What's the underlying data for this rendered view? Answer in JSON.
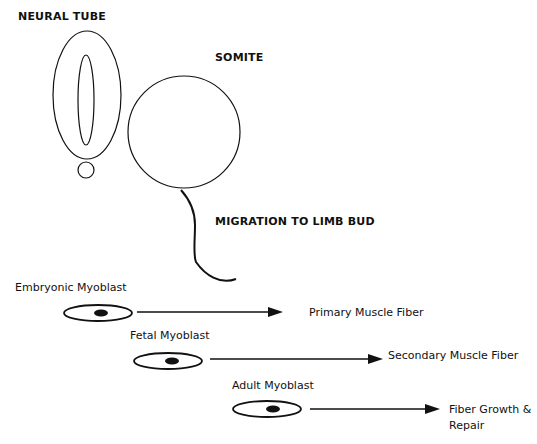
{
  "diagram": {
    "title_neural_tube": "NEURAL TUBE",
    "title_somite": "SOMITE",
    "migration_label": "MIGRATION TO LIMB BUD",
    "stages": [
      {
        "cell": "Embryonic Myoblast",
        "result": "Primary Muscle Fiber"
      },
      {
        "cell": "Fetal Myoblast",
        "result": "Secondary Muscle Fiber"
      },
      {
        "cell": "Adult Myoblast",
        "result_line1": "Fiber Growth &",
        "result_line2": "Repair"
      }
    ],
    "colors": {
      "stroke": "#111111",
      "background": "#ffffff"
    }
  }
}
